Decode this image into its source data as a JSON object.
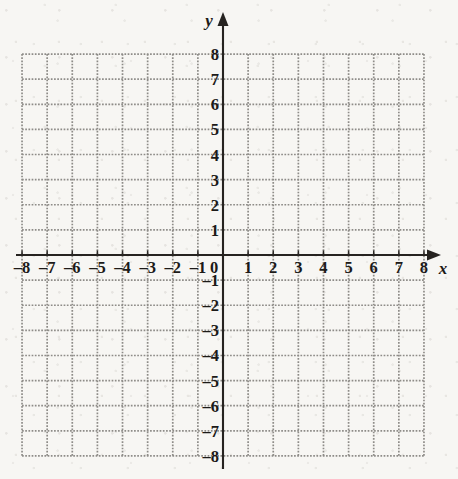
{
  "figure": {
    "kind": "coordinate-grid",
    "axis_labels": {
      "x": "x",
      "y": "y"
    },
    "origin_label": "0"
  },
  "chart_data": {
    "type": "scatter",
    "title": "",
    "subtitle": "",
    "xlabel": "x",
    "ylabel": "y",
    "xlim": [
      -8,
      8
    ],
    "ylim": [
      -8,
      8
    ],
    "xticks": [
      -8,
      -7,
      -6,
      -5,
      -4,
      -3,
      -2,
      -1,
      0,
      1,
      2,
      3,
      4,
      5,
      6,
      7,
      8
    ],
    "yticks": [
      -8,
      -7,
      -6,
      -5,
      -4,
      -3,
      -2,
      -1,
      0,
      1,
      2,
      3,
      4,
      5,
      6,
      7,
      8
    ],
    "xtick_labels": [
      "–8",
      "–7",
      "–6",
      "–5",
      "–4",
      "–3",
      "–2",
      "–1",
      "0",
      "1",
      "2",
      "3",
      "4",
      "5",
      "6",
      "7",
      "8"
    ],
    "ytick_labels": [
      "–8",
      "–7",
      "–6",
      "–5",
      "–4",
      "–3",
      "–2",
      "–1",
      "0",
      "1",
      "2",
      "3",
      "4",
      "5",
      "6",
      "7",
      "8"
    ],
    "grid": true,
    "grid_style": "dotted",
    "grid_color": "#8e8c88",
    "axis_color": "#262320",
    "background_color": "#f7f6f3",
    "legend": null,
    "series": [],
    "values": [],
    "annotations": [],
    "x_axis_arrow": "right",
    "y_axis_arrow": "up"
  },
  "x_labels_negative": [
    "–8",
    "–7",
    "–6",
    "–5",
    "–4",
    "–3",
    "–2",
    "–1"
  ],
  "x_labels_positive": [
    "1",
    "2",
    "3",
    "4",
    "5",
    "6",
    "7",
    "8"
  ],
  "y_labels_positive": [
    "1",
    "2",
    "3",
    "4",
    "5",
    "6",
    "7",
    "8"
  ],
  "y_labels_negative": [
    "–1",
    "–2",
    "–3",
    "–4",
    "–5",
    "–6",
    "–7",
    "–8"
  ]
}
